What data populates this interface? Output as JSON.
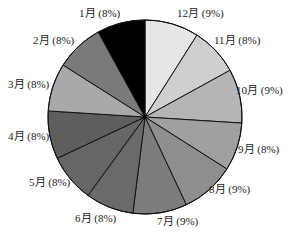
{
  "chart_data": {
    "type": "pie",
    "title": "",
    "start_angle_deg": 0,
    "direction": "clockwise",
    "center": [
      145,
      117
    ],
    "radius": 97,
    "slices": [
      {
        "label": "12月",
        "percent": 9,
        "text": "12月 (9%)",
        "color": "#e6e6e6",
        "label_pos": [
          177,
          17
        ]
      },
      {
        "label": "11月",
        "percent": 8,
        "text": "11月 (8%)",
        "color": "#cfcfcf",
        "label_pos": [
          214,
          44
        ]
      },
      {
        "label": "10月",
        "percent": 9,
        "text": "10月 (9%)",
        "color": "#b5b5b5",
        "label_pos": [
          236,
          94
        ]
      },
      {
        "label": "9月",
        "percent": 8,
        "text": "9月 (8%)",
        "color": "#a0a0a0",
        "label_pos": [
          238,
          153
        ]
      },
      {
        "label": "8月",
        "percent": 9,
        "text": "8月 (9%)",
        "color": "#8e8e8e",
        "label_pos": [
          209,
          193
        ]
      },
      {
        "label": "7月",
        "percent": 9,
        "text": "7月 (9%)",
        "color": "#7c7c7c",
        "label_pos": [
          157,
          225
        ]
      },
      {
        "label": "6月",
        "percent": 8,
        "text": "6月 (8%)",
        "color": "#6a6a6a",
        "label_pos": [
          75,
          222
        ]
      },
      {
        "label": "5月",
        "percent": 8,
        "text": "5月 (8%)",
        "color": "#666666",
        "label_pos": [
          29,
          186
        ]
      },
      {
        "label": "4月",
        "percent": 8,
        "text": "4月 (8%)",
        "color": "#5e5e5e",
        "label_pos": [
          8,
          140
        ]
      },
      {
        "label": "3月",
        "percent": 8,
        "text": "3月 (8%)",
        "color": "#a9a9a9",
        "label_pos": [
          8,
          88
        ]
      },
      {
        "label": "2月",
        "percent": 8,
        "text": "2月 (8%)",
        "color": "#7a7a7a",
        "label_pos": [
          33,
          44
        ]
      },
      {
        "label": "1月",
        "percent": 8,
        "text": "1月 (8%)",
        "color": "#000000",
        "label_pos": [
          79,
          17
        ]
      }
    ],
    "legend": "none",
    "edge_color": "#111111"
  }
}
